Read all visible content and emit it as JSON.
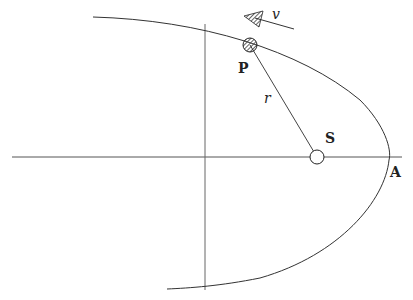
{
  "diagram": {
    "type": "orbit-parabola",
    "labels": {
      "planet": "P",
      "sun": "S",
      "apex": "A",
      "radius": "r",
      "velocity": "v"
    },
    "colors": {
      "stroke": "#333333",
      "axis": "#555555",
      "background": "#ffffff"
    },
    "elements": [
      {
        "name": "parabolic-orbit",
        "kind": "curve"
      },
      {
        "name": "horizontal-axis",
        "kind": "line"
      },
      {
        "name": "vertical-axis",
        "kind": "line"
      },
      {
        "name": "radius-line",
        "kind": "line",
        "from": "S",
        "to": "P"
      },
      {
        "name": "velocity-arrow",
        "kind": "arrow",
        "at": "P"
      },
      {
        "name": "planet-body",
        "kind": "hatched-circle",
        "at": "P"
      },
      {
        "name": "sun-focus",
        "kind": "open-circle",
        "at": "S"
      }
    ]
  }
}
